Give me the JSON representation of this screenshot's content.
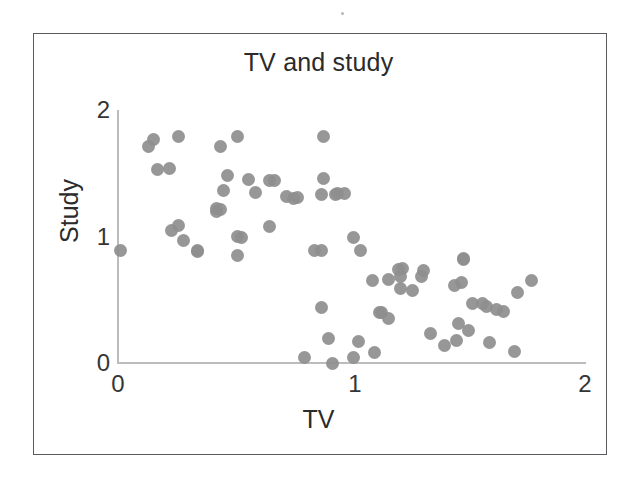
{
  "figure": {
    "title": "TV and study",
    "frame": {
      "border_color": "#5a5a5e"
    },
    "point_color": "#8e8e8e",
    "axis_color": "#bcbcbc",
    "text_color": "#2b2b2b"
  },
  "axes": {
    "x_label": "TV",
    "y_label": "Study",
    "x_ticks": [
      "0",
      "1",
      "2"
    ],
    "y_ticks": [
      "0",
      "1",
      "2"
    ]
  },
  "chart_data": {
    "type": "scatter",
    "title": "TV and study",
    "xlabel": "TV",
    "ylabel": "Study",
    "xlim": [
      0,
      2
    ],
    "ylim": [
      0,
      2
    ],
    "xticks": [
      0,
      1,
      2
    ],
    "yticks": [
      0,
      1,
      2
    ],
    "grid": false,
    "legend": false,
    "marker": "circle",
    "marker_color": "#8e8e8e",
    "n_points": 76,
    "points": [
      [
        0.01,
        0.89
      ],
      [
        0.15,
        1.77
      ],
      [
        0.13,
        1.71
      ],
      [
        0.26,
        1.79
      ],
      [
        0.17,
        1.53
      ],
      [
        0.22,
        1.54
      ],
      [
        0.23,
        1.05
      ],
      [
        0.26,
        1.09
      ],
      [
        0.28,
        0.97
      ],
      [
        0.34,
        0.89
      ],
      [
        0.42,
        1.2
      ],
      [
        0.44,
        1.71
      ],
      [
        0.51,
        1.79
      ],
      [
        0.47,
        1.48
      ],
      [
        0.45,
        1.36
      ],
      [
        0.42,
        1.22
      ],
      [
        0.51,
        1.0
      ],
      [
        0.53,
        0.99
      ],
      [
        0.51,
        0.85
      ],
      [
        0.44,
        1.21
      ],
      [
        0.65,
        1.08
      ],
      [
        0.65,
        1.44
      ],
      [
        0.67,
        1.44
      ],
      [
        0.72,
        1.32
      ],
      [
        0.75,
        1.3
      ],
      [
        0.88,
        1.79
      ],
      [
        0.88,
        1.46
      ],
      [
        0.87,
        1.33
      ],
      [
        0.94,
        1.34
      ],
      [
        1.01,
        0.99
      ],
      [
        1.04,
        0.89
      ],
      [
        0.84,
        0.89
      ],
      [
        0.87,
        0.89
      ],
      [
        0.87,
        0.44
      ],
      [
        0.9,
        0.19
      ],
      [
        0.8,
        0.04
      ],
      [
        0.92,
        0.0
      ],
      [
        1.01,
        0.04
      ],
      [
        1.03,
        0.17
      ],
      [
        1.09,
        0.65
      ],
      [
        1.16,
        0.66
      ],
      [
        1.13,
        0.4
      ],
      [
        1.16,
        0.35
      ],
      [
        1.22,
        0.75
      ],
      [
        1.21,
        0.68
      ],
      [
        1.21,
        0.59
      ],
      [
        1.26,
        0.57
      ],
      [
        1.2,
        0.74
      ],
      [
        1.31,
        0.73
      ],
      [
        1.34,
        0.23
      ],
      [
        1.4,
        0.14
      ],
      [
        1.44,
        0.61
      ],
      [
        1.48,
        0.83
      ],
      [
        1.47,
        0.64
      ],
      [
        1.52,
        0.47
      ],
      [
        1.46,
        0.31
      ],
      [
        1.5,
        0.26
      ],
      [
        1.45,
        0.18
      ],
      [
        1.58,
        0.45
      ],
      [
        1.62,
        0.42
      ],
      [
        1.65,
        0.41
      ],
      [
        1.59,
        0.16
      ],
      [
        1.7,
        0.09
      ],
      [
        1.71,
        0.56
      ],
      [
        1.77,
        0.65
      ],
      [
        1.48,
        0.82
      ],
      [
        0.56,
        1.45
      ],
      [
        0.59,
        1.35
      ],
      [
        0.34,
        0.88
      ],
      [
        0.93,
        1.33
      ],
      [
        0.97,
        1.34
      ],
      [
        1.1,
        0.08
      ],
      [
        1.3,
        0.68
      ],
      [
        1.56,
        0.47
      ],
      [
        1.12,
        0.4
      ],
      [
        0.77,
        1.31
      ]
    ]
  }
}
